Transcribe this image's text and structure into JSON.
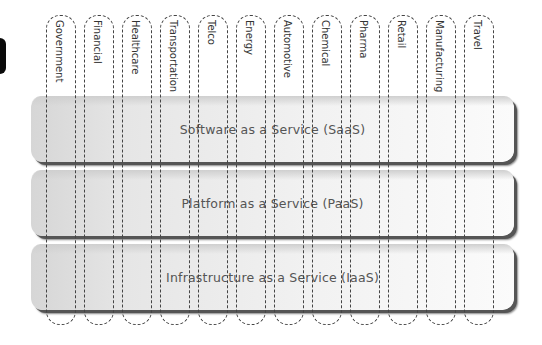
{
  "layers": [
    {
      "label": "Software as a Service (SaaS)",
      "top": 96
    },
    {
      "label": "Platform as a Service (PaaS)",
      "top": 170
    },
    {
      "label": "Infrastructure as a Service (IaaS)",
      "top": 244
    }
  ],
  "verticals": [
    {
      "label": "Government"
    },
    {
      "label": "Financial"
    },
    {
      "label": "Healthcare"
    },
    {
      "label": "Transportation"
    },
    {
      "label": "Telco"
    },
    {
      "label": "Energy"
    },
    {
      "label": "Automotive"
    },
    {
      "label": "Chemical"
    },
    {
      "label": "Pharma"
    },
    {
      "label": "Retail"
    },
    {
      "label": "Manufacturing"
    },
    {
      "label": "Travel"
    }
  ],
  "colors": {
    "band_shadow": "#555555",
    "dash": "#444444",
    "text": "#555555"
  }
}
